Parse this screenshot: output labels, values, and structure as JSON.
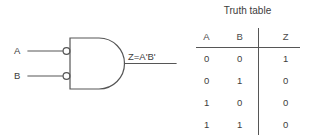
{
  "diagram": {
    "title": "",
    "gate": {
      "type": "and-gate-with-inverted-inputs",
      "inputs": [
        {
          "label": "A",
          "inverted": true
        },
        {
          "label": "B",
          "inverted": true
        }
      ],
      "output_label": "Z=A'B'"
    }
  },
  "truth_table": {
    "title": "Truth table",
    "columns": [
      "A",
      "B",
      "Z"
    ],
    "rows": [
      {
        "a": "0",
        "b": "0",
        "z": "1"
      },
      {
        "a": "0",
        "b": "1",
        "z": "0"
      },
      {
        "a": "1",
        "b": "0",
        "z": "0"
      },
      {
        "a": "1",
        "b": "1",
        "z": "0"
      }
    ]
  },
  "colors": {
    "line": "#565656",
    "text": "#3d3d3d",
    "background": "#ffffff"
  }
}
